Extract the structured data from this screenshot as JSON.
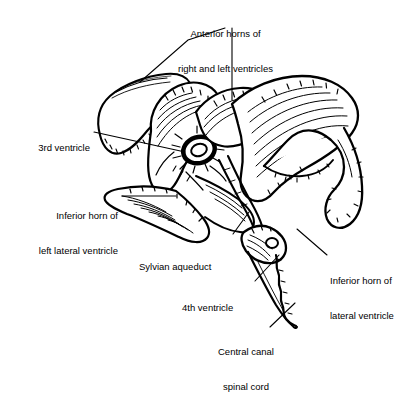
{
  "figure": {
    "type": "anatomical-line-drawing",
    "background_color": "#ffffff",
    "ink_color": "#000000",
    "width": 417,
    "height": 357
  },
  "labels": [
    {
      "id": "anterior-horns",
      "line1": "Anterior horns of",
      "line2": "right and left ventricles",
      "align": "center",
      "x": 148,
      "y": 5,
      "width": 155
    },
    {
      "id": "third-ventricle",
      "line1": "3rd ventricle",
      "line2": "",
      "align": "right",
      "x": 8,
      "y": 119,
      "width": 82
    },
    {
      "id": "inferior-horn-left",
      "line1": "Inferior horn of",
      "line2": "left lateral ventricle",
      "align": "right",
      "x": 8,
      "y": 187,
      "width": 110
    },
    {
      "id": "sylvian-aqueduct",
      "line1": "Sylvian aqueduct",
      "line2": "",
      "align": "left",
      "x": 139,
      "y": 238,
      "width": 100
    },
    {
      "id": "fourth-ventricle",
      "line1": "4th ventricle",
      "line2": "",
      "align": "left",
      "x": 182,
      "y": 279,
      "width": 80
    },
    {
      "id": "inferior-horn-lateral",
      "line1": "Inferior horn of",
      "line2": "lateral ventricle",
      "align": "left",
      "x": 330,
      "y": 252,
      "width": 88
    },
    {
      "id": "central-canal",
      "line1": "Central canal",
      "line2": "spinal cord",
      "align": "center",
      "x": 196,
      "y": 323,
      "width": 100
    }
  ],
  "leader_lines": [
    {
      "id": "leader-anterior-horns-left",
      "points": "225,28 188,40 140,82"
    },
    {
      "id": "leader-anterior-horns-right",
      "points": "232,28 232,63 232,100"
    },
    {
      "id": "leader-third-ventricle",
      "points": "94,132 185,152"
    },
    {
      "id": "leader-inferior-horn-left",
      "points": "122,196 175,196"
    },
    {
      "id": "leader-sylvian-aqueduct",
      "points": "233,234 248,213"
    },
    {
      "id": "leader-fourth-ventricle",
      "points": "255,281 278,256"
    },
    {
      "id": "leader-inferior-horn-lateral",
      "points": "327,255 297,229"
    },
    {
      "id": "leader-central-canal",
      "points": "270,327 294,304"
    }
  ]
}
